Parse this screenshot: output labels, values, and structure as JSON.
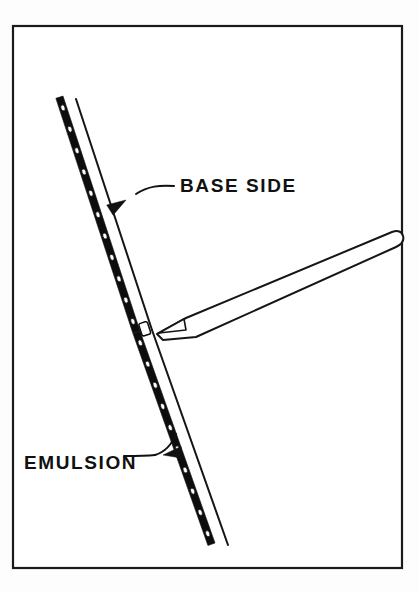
{
  "figure": {
    "background_color": "#fdfdfd",
    "ink_color": "#111111",
    "paper_color": "#ffffff",
    "width": 419,
    "height": 593
  },
  "frame": {
    "name": "illustration-border",
    "x": 13,
    "y": 26,
    "width": 389,
    "height": 542,
    "stroke_color": "#1a1a1a"
  },
  "labels": [
    {
      "id": "base-side",
      "text": "BASE SIDE",
      "x": 180,
      "y": 192,
      "anchor": "start",
      "leader": {
        "path": "M 174 186 C 160 185 148 186 136 194",
        "arrow_tip_x": 126,
        "arrow_tip_y": 200,
        "arrow_angle_deg": 148
      }
    },
    {
      "id": "emulsion",
      "text": "EMULSION",
      "x": 24,
      "y": 469,
      "anchor": "start",
      "leader": {
        "path": "M 124 456 C 136 456 146 456 155 455",
        "arrow_tip_x": 163,
        "arrow_tip_y": 455,
        "arrow_angle_deg": 352
      }
    }
  ],
  "film_strip": {
    "name": "film-strip",
    "description": "Bent photographic film strip seen edge-on",
    "base_side": {
      "label": "BASE SIDE",
      "upper_segment": {
        "x1": 76,
        "y1": 99,
        "x2": 152,
        "y2": 330
      },
      "lower_segment": {
        "x1": 152,
        "y1": 330,
        "x2": 228,
        "y2": 545
      }
    },
    "emulsion_side": {
      "label": "EMULSION",
      "band_width": 7.5,
      "upper_segment": {
        "x1": 63,
        "y1": 96,
        "x2": 140,
        "y2": 331
      },
      "lower_segment": {
        "x1": 140,
        "y1": 331,
        "x2": 215,
        "y2": 543
      }
    },
    "perforations": {
      "shape": "ellipse",
      "count_upper": 11,
      "count_lower": 10,
      "radius_x": 3.1,
      "radius_y": 2.0
    },
    "bend_point": {
      "x": 146,
      "y": 330
    }
  },
  "tool": {
    "name": "squeegee-tool",
    "description": "Long tapered tool with chisel tip touching the film at the bend",
    "tip": {
      "x": 157,
      "y": 333
    },
    "butt_end": {
      "x": 398,
      "y": 240
    },
    "body_outline": "M 157 334 L 186 318 L 392 232 Q 401 229 403 236 Q 405 243 396 247 L 196 337 L 163 340 Z",
    "facet": "M 159 333 L 184 319 L 186 330 Z",
    "end_cap_rounded": true
  },
  "contact": {
    "name": "contact-point",
    "x": 146,
    "y": 331,
    "note": "tool tip meets film bend"
  }
}
